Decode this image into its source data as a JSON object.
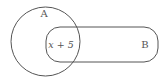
{
  "diagram": {
    "type": "venn",
    "sets": [
      {
        "id": "A",
        "label": "A",
        "shape": "circle"
      },
      {
        "id": "B",
        "label": "B",
        "shape": "rounded-rectangle"
      }
    ],
    "regions": [
      {
        "sets": [
          "A",
          "B"
        ],
        "label": "x + 5"
      }
    ],
    "colors": {
      "stroke": "#555555",
      "background": "#ffffff",
      "text": "#555555"
    }
  }
}
